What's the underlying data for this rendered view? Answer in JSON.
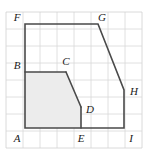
{
  "figure": {
    "canvas": {
      "width": 153,
      "height": 157
    },
    "grid": {
      "visible": true,
      "cell_size": 17,
      "origin_x": 6,
      "origin_y": 12,
      "columns": 8,
      "rows": 8,
      "line_color": "#d8d8d8",
      "border_color": "#d0d0d0"
    },
    "style": {
      "outline_color": "#4a4a4a",
      "outline_width": 1.6,
      "shaded_fill": "#ececec",
      "shaded_stroke": "#4a4a4a",
      "label_color": "#1a1a1a"
    },
    "vertices": [
      {
        "name": "A",
        "x": 25,
        "y": 128,
        "label": "A",
        "label_x": 17,
        "label_y": 139
      },
      {
        "name": "B",
        "x": 25,
        "y": 72,
        "label": "B",
        "label_x": 17,
        "label_y": 66
      },
      {
        "name": "C",
        "x": 66,
        "y": 72,
        "label": "C",
        "label_x": 66,
        "label_y": 62
      },
      {
        "name": "D",
        "x": 81,
        "y": 107,
        "label": "D",
        "label_x": 90,
        "label_y": 110
      },
      {
        "name": "E",
        "x": 81,
        "y": 128,
        "label": "E",
        "label_x": 81,
        "label_y": 139
      },
      {
        "name": "F",
        "x": 25,
        "y": 24,
        "label": "F",
        "label_x": 17,
        "label_y": 18
      },
      {
        "name": "G",
        "x": 98,
        "y": 24,
        "label": "G",
        "label_x": 102,
        "label_y": 18
      },
      {
        "name": "H",
        "x": 124,
        "y": 90,
        "label": "H",
        "label_x": 134,
        "label_y": 92
      },
      {
        "name": "I",
        "x": 124,
        "y": 128,
        "label": "I",
        "label_x": 131,
        "label_y": 139
      }
    ],
    "outline_path": "M 25 128 L 25 24 L 98 24 L 124 90 L 124 128 Z",
    "outline_sequence": [
      "A",
      "F",
      "G",
      "H",
      "I"
    ],
    "shaded_path": "M 25 128 L 25 72 L 66 72 L 81 107 L 81 128 Z",
    "shaded_sequence": [
      "A",
      "B",
      "C",
      "D",
      "E"
    ],
    "inner_segments": [
      {
        "from": "B",
        "to": "C",
        "x1": 25,
        "y1": 72,
        "x2": 66,
        "y2": 72
      },
      {
        "from": "C",
        "to": "D",
        "x1": 66,
        "y1": 72,
        "x2": 81,
        "y2": 107
      },
      {
        "from": "D",
        "to": "E",
        "x1": 81,
        "y1": 107,
        "x2": 81,
        "y2": 128
      }
    ]
  }
}
